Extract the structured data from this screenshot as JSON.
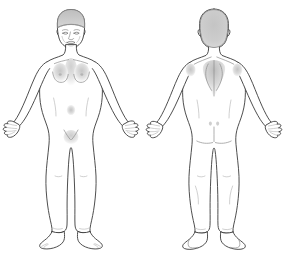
{
  "canvas": {
    "width": 285,
    "height": 257,
    "background_color": "#ffffff"
  },
  "diagram": {
    "view_count": 2,
    "style": "line drawing with gray shading",
    "colors": {
      "background": "#ffffff",
      "outline_stroke": "#3a3a3a",
      "body_fill": "#ffffff",
      "hair_shade": "#c9c9c9",
      "soft_shade": "#dcdcdc",
      "mid_shade": "#cfcfcf",
      "detail_stroke": "#8c8c8c",
      "feature_stroke": "#6e6e6e"
    }
  },
  "figures": [
    {
      "id": "front",
      "name": "front-view-figure",
      "label": "Front view",
      "orientation": "anterior",
      "position": "left",
      "pose": "standing, arms slightly abducted, palms forward",
      "visible_features": [
        "hair",
        "face",
        "eyebrows",
        "eyes",
        "nose",
        "mouth",
        "ears",
        "neck",
        "clavicle shading",
        "shoulders",
        "breasts",
        "nipples",
        "sternum shading",
        "abdomen",
        "navel",
        "pubic region",
        "arms",
        "hands with fingers",
        "thighs",
        "knees",
        "shins",
        "ankles",
        "feet with toes"
      ]
    },
    {
      "id": "back",
      "name": "back-view-figure",
      "label": "Back view",
      "orientation": "posterior",
      "position": "right",
      "pose": "standing, arms slightly abducted, backs of hands forward",
      "visible_features": [
        "hair covering head",
        "ears",
        "neck",
        "shoulders",
        "deltoid shading",
        "scapulae shading",
        "spine shading",
        "lower back",
        "sacral dimples",
        "buttocks",
        "gluteal folds",
        "arms",
        "hands with fingers",
        "thighs",
        "calves",
        "heels",
        "feet"
      ]
    }
  ]
}
